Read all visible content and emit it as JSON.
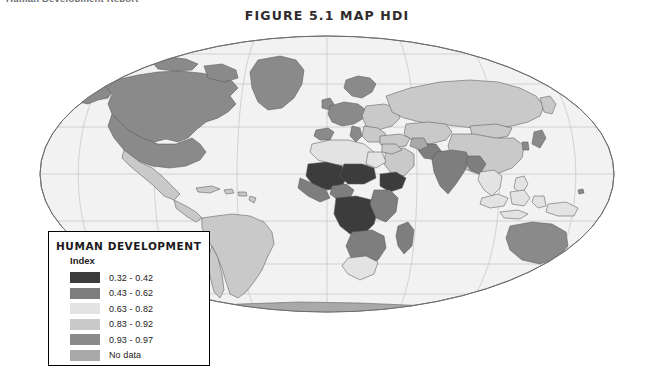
{
  "running_header": "Human Development Report",
  "figure": {
    "title": "FIGURE 5.1 MAP HDI"
  },
  "legend": {
    "title": "HUMAN DEVELOPMENT",
    "subtitle": "Index",
    "entries": [
      {
        "label": "0.32 - 0.42",
        "color": "#3c3c3c"
      },
      {
        "label": "0.43 - 0.62",
        "color": "#7e7e7e"
      },
      {
        "label": "0.63 - 0.82",
        "color": "#e3e3e3"
      },
      {
        "label": "0.83 - 0.92",
        "color": "#c9c9c9"
      },
      {
        "label": "0.93 - 0.97",
        "color": "#8a8a8a"
      },
      {
        "label": "No data",
        "color": "#a9a9a9"
      }
    ]
  },
  "map": {
    "projection": "winkel-tripel",
    "ocean_color": "#f2f2f2",
    "graticule_color": "#c6c6c6",
    "outline_color": "#6e6e6e",
    "border_color": "#4a4a4a",
    "regions": [
      {
        "name": "Greenland",
        "class": "hdi-93-97"
      },
      {
        "name": "Canada",
        "class": "hdi-93-97"
      },
      {
        "name": "United States",
        "class": "hdi-93-97"
      },
      {
        "name": "Alaska",
        "class": "hdi-93-97"
      },
      {
        "name": "Mexico",
        "class": "hdi-83-92"
      },
      {
        "name": "Central America",
        "class": "hdi-83-92"
      },
      {
        "name": "Caribbean",
        "class": "hdi-83-92"
      },
      {
        "name": "Brazil",
        "class": "hdi-83-92"
      },
      {
        "name": "Andean South America",
        "class": "hdi-83-92"
      },
      {
        "name": "Southern Cone",
        "class": "hdi-83-92"
      },
      {
        "name": "Western Europe",
        "class": "hdi-93-97"
      },
      {
        "name": "Scandinavia",
        "class": "hdi-93-97"
      },
      {
        "name": "Eastern Europe",
        "class": "hdi-83-92"
      },
      {
        "name": "Russia",
        "class": "hdi-83-92"
      },
      {
        "name": "Central Asia",
        "class": "hdi-83-92"
      },
      {
        "name": "China",
        "class": "hdi-83-92"
      },
      {
        "name": "Mongolia",
        "class": "hdi-83-92"
      },
      {
        "name": "Japan",
        "class": "hdi-93-97"
      },
      {
        "name": "Korea",
        "class": "hdi-93-97"
      },
      {
        "name": "India",
        "class": "hdi-43-62"
      },
      {
        "name": "Pakistan",
        "class": "hdi-43-62"
      },
      {
        "name": "Afghanistan",
        "class": "no-data"
      },
      {
        "name": "Middle East",
        "class": "hdi-83-92"
      },
      {
        "name": "Southeast Asia",
        "class": "hdi-63-82"
      },
      {
        "name": "Indonesia",
        "class": "hdi-63-82"
      },
      {
        "name": "Australia",
        "class": "hdi-93-97"
      },
      {
        "name": "New Zealand",
        "class": "hdi-93-97"
      },
      {
        "name": "North Africa",
        "class": "hdi-63-82"
      },
      {
        "name": "Sahel",
        "class": "hdi-32-42"
      },
      {
        "name": "West Africa",
        "class": "hdi-32-42"
      },
      {
        "name": "Central Africa",
        "class": "hdi-32-42"
      },
      {
        "name": "Horn of Africa",
        "class": "hdi-32-42"
      },
      {
        "name": "East Africa",
        "class": "hdi-43-62"
      },
      {
        "name": "Southern Africa",
        "class": "hdi-43-62"
      },
      {
        "name": "South Africa",
        "class": "hdi-63-82"
      },
      {
        "name": "Madagascar",
        "class": "hdi-43-62"
      },
      {
        "name": "Antarctica",
        "class": "no-data"
      }
    ]
  }
}
